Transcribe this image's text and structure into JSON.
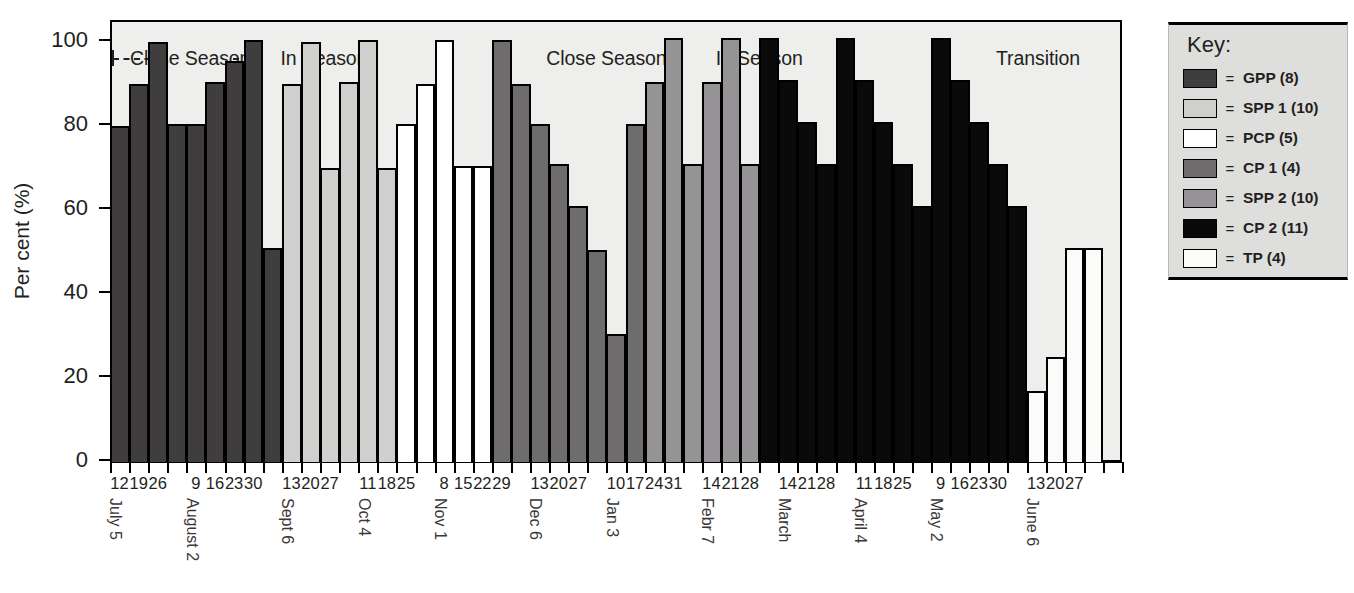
{
  "chart_data": {
    "type": "bar",
    "title": "",
    "xlabel": "",
    "ylabel": "Per cent (%)",
    "ylim": [
      0,
      100
    ],
    "ytick_labels": [
      "0",
      "20",
      "40",
      "60",
      "80",
      "100"
    ],
    "ytick_values": [
      0,
      20,
      40,
      60,
      80,
      100
    ],
    "grid": false,
    "legend_position": "right-outside",
    "xtick_labels": [
      "12",
      "19",
      "26",
      "",
      "9",
      "16",
      "23",
      "30",
      "",
      "13",
      "20",
      "27",
      "",
      "11",
      "18",
      "25",
      "",
      "8",
      "15",
      "22",
      "29",
      "",
      "13",
      "20",
      "27",
      "",
      "10",
      "17",
      "24",
      "31",
      "",
      "14",
      "21",
      "28",
      "",
      "14",
      "21",
      "28",
      "",
      "11",
      "18",
      "25",
      "",
      "9",
      "16",
      "23",
      "30",
      "",
      "13",
      "20",
      "27",
      "",
      ""
    ],
    "month_labels": [
      {
        "label": "July 5",
        "index": 0
      },
      {
        "label": "August 2",
        "index": 4
      },
      {
        "label": "Sept 6",
        "index": 9
      },
      {
        "label": "Oct 4",
        "index": 13
      },
      {
        "label": "Nov 1",
        "index": 17
      },
      {
        "label": "Dec 6",
        "index": 22
      },
      {
        "label": "Jan 3",
        "index": 26
      },
      {
        "label": "Febr 7",
        "index": 31
      },
      {
        "label": "March",
        "index": 35
      },
      {
        "label": "April 4",
        "index": 39
      },
      {
        "label": "May 2",
        "index": 43
      },
      {
        "label": "June 6",
        "index": 48
      }
    ],
    "series_names": [
      "GPP (8)",
      "SPP 1 (10)",
      "PCP (5)",
      "CP 1 (4)",
      "SPP 2 (10)",
      "CP 2 (11)",
      "TP (4)"
    ],
    "bars": [
      {
        "index": 0,
        "value": 80,
        "series": "GPP"
      },
      {
        "index": 1,
        "value": 90,
        "series": "GPP"
      },
      {
        "index": 2,
        "value": 100,
        "series": "GPP"
      },
      {
        "index": 3,
        "value": 80.5,
        "series": "GPP"
      },
      {
        "index": 4,
        "value": 80.5,
        "series": "GPP"
      },
      {
        "index": 5,
        "value": 90.5,
        "series": "GPP"
      },
      {
        "index": 6,
        "value": 95.5,
        "series": "GPP"
      },
      {
        "index": 7,
        "value": 100.5,
        "series": "GPP"
      },
      {
        "index": 8,
        "value": 51,
        "series": "GPP"
      },
      {
        "index": 9,
        "value": 90,
        "series": "SPP 1"
      },
      {
        "index": 10,
        "value": 100,
        "series": "SPP 1"
      },
      {
        "index": 11,
        "value": 70,
        "series": "SPP 1"
      },
      {
        "index": 12,
        "value": 90.5,
        "series": "SPP 1"
      },
      {
        "index": 13,
        "value": 100.5,
        "series": "SPP 1"
      },
      {
        "index": 14,
        "value": 70,
        "series": "SPP 1"
      },
      {
        "index": 15,
        "value": 80.5,
        "series": "PCP"
      },
      {
        "index": 16,
        "value": 90,
        "series": "PCP"
      },
      {
        "index": 17,
        "value": 100.5,
        "series": "PCP"
      },
      {
        "index": 18,
        "value": 70.5,
        "series": "PCP"
      },
      {
        "index": 19,
        "value": 70.5,
        "series": "PCP"
      },
      {
        "index": 20,
        "value": 100.5,
        "series": "CP 1"
      },
      {
        "index": 21,
        "value": 90,
        "series": "CP 1"
      },
      {
        "index": 22,
        "value": 80.5,
        "series": "CP 1"
      },
      {
        "index": 23,
        "value": 71,
        "series": "CP 1"
      },
      {
        "index": 24,
        "value": 61,
        "series": "CP 1"
      },
      {
        "index": 25,
        "value": 50.5,
        "series": "CP 1"
      },
      {
        "index": 26,
        "value": 30.5,
        "series": "CP 1"
      },
      {
        "index": 27,
        "value": 80.5,
        "series": "CP 1"
      },
      {
        "index": 28,
        "value": 90.5,
        "series": "SPP 2"
      },
      {
        "index": 29,
        "value": 101,
        "series": "SPP 2"
      },
      {
        "index": 30,
        "value": 71,
        "series": "SPP 2"
      },
      {
        "index": 31,
        "value": 90.5,
        "series": "SPP 2"
      },
      {
        "index": 32,
        "value": 101,
        "series": "SPP 2"
      },
      {
        "index": 33,
        "value": 71,
        "series": "SPP 2"
      },
      {
        "index": 34,
        "value": 101,
        "series": "CP 2"
      },
      {
        "index": 35,
        "value": 91,
        "series": "CP 2"
      },
      {
        "index": 36,
        "value": 81,
        "series": "CP 2"
      },
      {
        "index": 37,
        "value": 71,
        "series": "CP 2"
      },
      {
        "index": 38,
        "value": 101,
        "series": "CP 2"
      },
      {
        "index": 39,
        "value": 91,
        "series": "CP 2"
      },
      {
        "index": 40,
        "value": 81,
        "series": "CP 2"
      },
      {
        "index": 41,
        "value": 71,
        "series": "CP 2"
      },
      {
        "index": 42,
        "value": 61,
        "series": "CP 2"
      },
      {
        "index": 43,
        "value": 101,
        "series": "CP 2"
      },
      {
        "index": 44,
        "value": 91,
        "series": "CP 2"
      },
      {
        "index": 45,
        "value": 81,
        "series": "CP 2"
      },
      {
        "index": 46,
        "value": 71,
        "series": "CP 2"
      },
      {
        "index": 47,
        "value": 61,
        "series": "CP 2"
      },
      {
        "index": 48,
        "value": 17,
        "series": "TP"
      },
      {
        "index": 49,
        "value": 25,
        "series": "TP"
      },
      {
        "index": 50,
        "value": 51,
        "series": "TP"
      },
      {
        "index": 51,
        "value": 51,
        "series": "TP"
      }
    ],
    "annotations": [
      {
        "label": "Close Season",
        "center_index": 4.2,
        "dash_left": true,
        "dash_right": true
      },
      {
        "label": "In Season",
        "center_index": 11.2,
        "dash_left": false,
        "dash_right": false
      },
      {
        "label": "Close Season",
        "center_index": 26.0,
        "dash_left": false,
        "dash_right": false
      },
      {
        "label": "In Season",
        "center_index": 34.0,
        "dash_left": false,
        "dash_right": false
      },
      {
        "label": "Transition",
        "center_index": 48.6,
        "dash_left": false,
        "dash_right": false
      }
    ]
  },
  "legend": {
    "title": "Key:",
    "equals": "=",
    "items": [
      {
        "label": "GPP (8)",
        "color": "#403d3e"
      },
      {
        "label": "SPP 1 (10)",
        "color": "#cfcfcd"
      },
      {
        "label": "PCP (5)",
        "color": "#ffffff"
      },
      {
        "label": "CP 1 (4)",
        "color": "#6e6c6d"
      },
      {
        "label": "SPP 2 (10)",
        "color": "#959395"
      },
      {
        "label": "CP 2 (11)",
        "color": "#0a0a0a"
      },
      {
        "label": "TP (4)",
        "color": "#fbfbf9"
      }
    ]
  },
  "series_colors": {
    "GPP": "#403d3e",
    "SPP 1": "#cfcfcd",
    "PCP": "#ffffff",
    "CP 1": "#6e6c6d",
    "SPP 2": "#959395",
    "CP 2": "#0a0a0a",
    "TP": "#fbfbf9"
  }
}
